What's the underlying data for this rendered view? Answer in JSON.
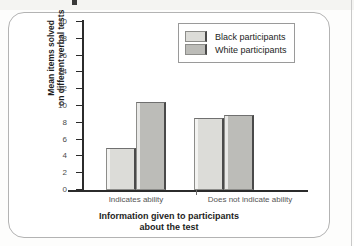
{
  "chart_data": {
    "type": "bar",
    "title": "",
    "categories": [
      "Indicates ability",
      "Does not indicate ability"
    ],
    "series": [
      {
        "name": "Black participants",
        "values": [
          5.0,
          8.6
        ],
        "color": "#dcdcd8"
      },
      {
        "name": "White participants",
        "values": [
          10.5,
          8.9
        ],
        "color": "#bcbcb8"
      }
    ],
    "xlabel": "Information given to participants about the test",
    "xlabel_line1": "Information given to participants",
    "xlabel_line2": "about the test",
    "ylabel": "Mean items solved on different verbal tests",
    "ylabel_line1": "Mean items solved",
    "ylabel_line2": "on different verbal tests",
    "ylim": [
      0,
      20
    ],
    "ytick_step": 2,
    "ytick_labels": [
      "20",
      "18",
      "16",
      "14",
      "12",
      "10",
      "8",
      "6",
      "4",
      "2",
      "0"
    ],
    "grid": false,
    "legend_position": "top-right"
  },
  "legend": {
    "entries": [
      {
        "label": "Black participants",
        "swatch": "light-gray-swatch"
      },
      {
        "label": "White participants",
        "swatch": "dark-gray-swatch"
      }
    ]
  },
  "colors": {
    "bar_light": "#dcdcd8",
    "bar_dark": "#bcbcb8",
    "axis": "#2b2b2b",
    "frame": "#b3b3b3",
    "text": "#1d1d1d"
  }
}
